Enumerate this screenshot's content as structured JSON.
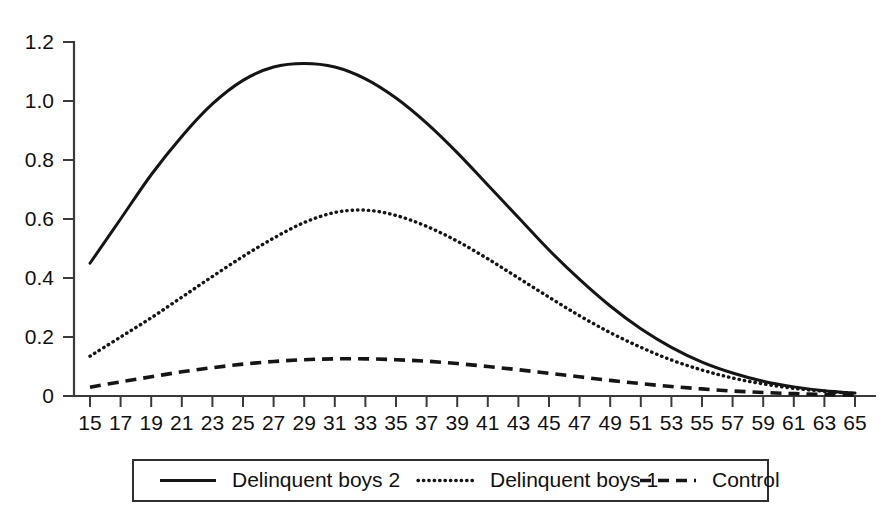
{
  "chart_data": {
    "type": "line",
    "title": "",
    "subtitle": "",
    "xlabel": "",
    "ylabel": "",
    "xlim": [
      15,
      65
    ],
    "ylim": [
      0,
      1.2
    ],
    "grid": false,
    "legend_position": "bottom",
    "y_ticks": [
      "0",
      "0.2",
      "0.4",
      "0.6",
      "0.8",
      "1.0",
      "1.2"
    ],
    "y_tick_values": [
      0,
      0.2,
      0.4,
      0.6,
      0.8,
      1.0,
      1.2
    ],
    "x": [
      15,
      17,
      19,
      21,
      23,
      25,
      27,
      29,
      31,
      33,
      35,
      37,
      39,
      41,
      43,
      45,
      47,
      49,
      51,
      53,
      55,
      57,
      59,
      61,
      63,
      65
    ],
    "x_tick_labels": [
      "15",
      "17",
      "19",
      "21",
      "23",
      "25",
      "27",
      "29",
      "31",
      "33",
      "35",
      "37",
      "39",
      "41",
      "43",
      "45",
      "47",
      "49",
      "51",
      "53",
      "55",
      "57",
      "59",
      "61",
      "63",
      "65"
    ],
    "series": [
      {
        "name": "Delinquent boys 2",
        "style": "solid",
        "color": "#151515",
        "values": [
          0.45,
          0.6,
          0.75,
          0.88,
          0.99,
          1.07,
          1.115,
          1.127,
          1.115,
          1.075,
          1.01,
          0.925,
          0.825,
          0.715,
          0.605,
          0.495,
          0.395,
          0.305,
          0.228,
          0.165,
          0.115,
          0.078,
          0.05,
          0.031,
          0.018,
          0.01
        ]
      },
      {
        "name": "Delinquent boys 1",
        "style": "dotted",
        "color": "#151515",
        "values": [
          0.135,
          0.2,
          0.265,
          0.335,
          0.405,
          0.473,
          0.535,
          0.588,
          0.622,
          0.63,
          0.612,
          0.575,
          0.525,
          0.465,
          0.4,
          0.335,
          0.272,
          0.215,
          0.165,
          0.122,
          0.088,
          0.061,
          0.041,
          0.026,
          0.016,
          0.009
        ]
      },
      {
        "name": "Control",
        "style": "dashed",
        "color": "#151515",
        "values": [
          0.03,
          0.048,
          0.065,
          0.082,
          0.096,
          0.108,
          0.117,
          0.123,
          0.126,
          0.126,
          0.123,
          0.118,
          0.11,
          0.1,
          0.089,
          0.077,
          0.065,
          0.053,
          0.042,
          0.032,
          0.024,
          0.017,
          0.012,
          0.008,
          0.005,
          0.003
        ]
      }
    ]
  },
  "legend": {
    "items": [
      {
        "label": "Delinquent boys 2",
        "style": "solid"
      },
      {
        "label": "Delinquent boys 1",
        "style": "dotted"
      },
      {
        "label": "Control",
        "style": "dashed"
      }
    ]
  }
}
